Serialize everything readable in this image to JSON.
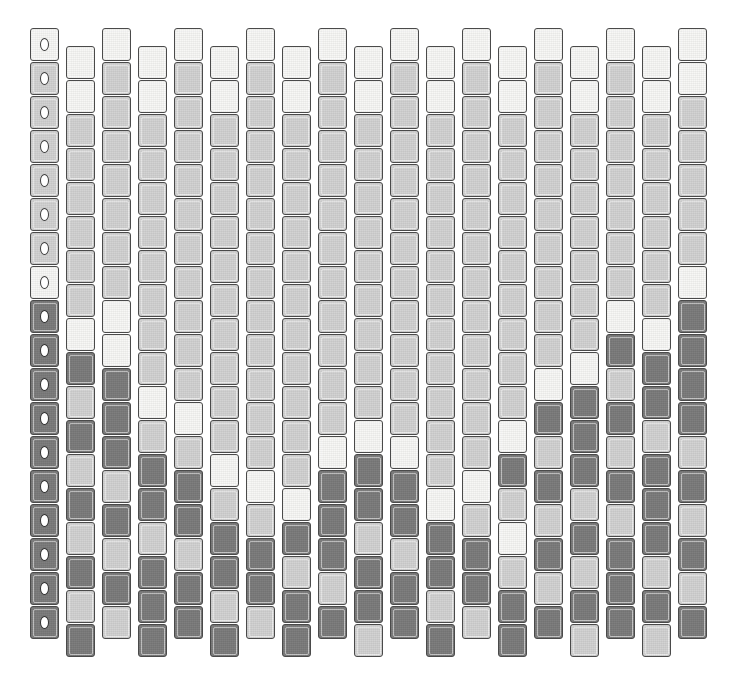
{
  "figure": {
    "kind": "staggered-tile-mosaic",
    "title": "",
    "background_color": "#ffffff",
    "canvas": {
      "width": 746,
      "height": 680
    }
  },
  "palette": {
    "white": "#f7f7f5",
    "light": "#d2d2d2",
    "dark": "#7b7b7b",
    "tile_border": "#4a4a4a",
    "marker_ring": "#3c3c3c",
    "marker_fill": "#ffffff"
  },
  "grid": {
    "columns": 19,
    "rows": 18,
    "column_pitch": 36,
    "row_pitch": 34,
    "origin_x": 30,
    "origin_y": 28,
    "tile_width": 29,
    "tile_height": 33,
    "stagger_offset": 18,
    "stagger_note": "even-indexed columns sit high, odd-indexed columns are shifted down by half a row"
  },
  "markers": {
    "column_index": 0,
    "glyph": "o",
    "count": 18,
    "description": "small white ring centered on every tile of the leftmost column"
  },
  "chart_data": {
    "type": "heatmap",
    "title": "",
    "xlabel": "",
    "ylabel": "",
    "legend": [
      "white",
      "light",
      "dark"
    ],
    "value_legend": {
      "0": "white",
      "1": "light",
      "2": "dark"
    },
    "columns": 19,
    "rows": 18,
    "matrix": [
      [
        0,
        0,
        0,
        0,
        0,
        0,
        0,
        0,
        0,
        0,
        0,
        0,
        0,
        0,
        0,
        0,
        0,
        0,
        0
      ],
      [
        1,
        0,
        1,
        0,
        1,
        0,
        1,
        0,
        1,
        0,
        1,
        0,
        1,
        0,
        1,
        0,
        1,
        0,
        0
      ],
      [
        1,
        1,
        1,
        1,
        1,
        1,
        1,
        1,
        1,
        1,
        1,
        1,
        1,
        1,
        1,
        1,
        1,
        1,
        1
      ],
      [
        1,
        1,
        1,
        1,
        1,
        1,
        1,
        1,
        1,
        1,
        1,
        1,
        1,
        1,
        1,
        1,
        1,
        1,
        1
      ],
      [
        1,
        1,
        1,
        1,
        1,
        1,
        1,
        1,
        1,
        1,
        1,
        1,
        1,
        1,
        1,
        1,
        1,
        1,
        1
      ],
      [
        1,
        1,
        1,
        1,
        1,
        1,
        1,
        1,
        1,
        1,
        1,
        1,
        1,
        1,
        1,
        1,
        1,
        1,
        1
      ],
      [
        1,
        1,
        1,
        1,
        1,
        1,
        1,
        1,
        1,
        1,
        1,
        1,
        1,
        1,
        1,
        1,
        1,
        1,
        1
      ],
      [
        0,
        1,
        1,
        1,
        1,
        1,
        1,
        1,
        1,
        1,
        1,
        1,
        1,
        1,
        1,
        1,
        1,
        1,
        0
      ],
      [
        2,
        0,
        0,
        1,
        1,
        1,
        1,
        1,
        1,
        1,
        1,
        1,
        1,
        1,
        1,
        1,
        0,
        0,
        2
      ],
      [
        2,
        2,
        0,
        1,
        1,
        1,
        1,
        1,
        1,
        1,
        1,
        1,
        1,
        1,
        1,
        0,
        2,
        2,
        2
      ],
      [
        2,
        1,
        2,
        0,
        1,
        1,
        1,
        1,
        1,
        1,
        1,
        1,
        1,
        1,
        0,
        2,
        1,
        2,
        2
      ],
      [
        2,
        2,
        2,
        1,
        0,
        1,
        1,
        1,
        1,
        0,
        1,
        1,
        1,
        0,
        2,
        2,
        2,
        1,
        2
      ],
      [
        2,
        1,
        2,
        2,
        1,
        0,
        1,
        1,
        0,
        2,
        0,
        1,
        1,
        2,
        1,
        2,
        1,
        2,
        1
      ],
      [
        2,
        2,
        1,
        2,
        2,
        1,
        0,
        0,
        2,
        2,
        2,
        0,
        0,
        1,
        2,
        1,
        2,
        2,
        2
      ],
      [
        2,
        1,
        2,
        1,
        2,
        2,
        1,
        2,
        2,
        1,
        2,
        2,
        1,
        0,
        1,
        2,
        1,
        2,
        1
      ],
      [
        2,
        2,
        1,
        2,
        1,
        2,
        2,
        1,
        2,
        2,
        1,
        2,
        2,
        1,
        2,
        1,
        2,
        1,
        2
      ],
      [
        2,
        1,
        2,
        2,
        2,
        1,
        2,
        2,
        1,
        2,
        2,
        1,
        2,
        2,
        1,
        2,
        2,
        2,
        1
      ],
      [
        2,
        2,
        1,
        2,
        2,
        2,
        1,
        2,
        2,
        1,
        2,
        2,
        1,
        2,
        2,
        1,
        2,
        1,
        2
      ]
    ]
  }
}
